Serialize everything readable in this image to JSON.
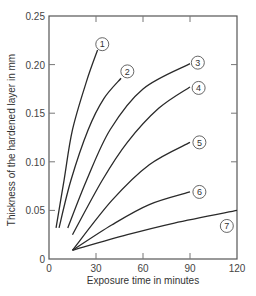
{
  "chart_data": {
    "type": "line",
    "title": "",
    "xlabel": "Exposure time in minutes",
    "ylabel": "Thickness of the hardened layer in mm",
    "xlim": [
      0,
      120
    ],
    "ylim": [
      0,
      0.25
    ],
    "xticks": [
      0,
      30,
      60,
      90,
      120
    ],
    "xtick_labels": [
      "0",
      "30",
      "60",
      "90",
      "120"
    ],
    "yticks": [
      0,
      0.05,
      0.1,
      0.15,
      0.2,
      0.25
    ],
    "ytick_labels": [
      "0",
      "0.05",
      "0.10",
      "0.15",
      "0.20",
      "0.25"
    ],
    "grid": false,
    "legend": "inline circled numbers at curve ends",
    "series": [
      {
        "name": "1",
        "points": [
          [
            4.5,
            0.032
          ],
          [
            9.6,
            0.081
          ],
          [
            15,
            0.133
          ],
          [
            24,
            0.183
          ],
          [
            31,
            0.215
          ]
        ],
        "label_pos": [
          34,
          0.221
        ]
      },
      {
        "name": "2",
        "points": [
          [
            6.4,
            0.032
          ],
          [
            14,
            0.081
          ],
          [
            25,
            0.133
          ],
          [
            35,
            0.165
          ],
          [
            46,
            0.186
          ]
        ],
        "label_pos": [
          50,
          0.193
        ]
      },
      {
        "name": "3",
        "points": [
          [
            12,
            0.032
          ],
          [
            24,
            0.081
          ],
          [
            39,
            0.133
          ],
          [
            60,
            0.175
          ],
          [
            90,
            0.201
          ]
        ],
        "label_pos": [
          95,
          0.202
        ]
      },
      {
        "name": "4",
        "points": [
          [
            15,
            0.025
          ],
          [
            34,
            0.081
          ],
          [
            50,
            0.12
          ],
          [
            70,
            0.155
          ],
          [
            90,
            0.177
          ]
        ],
        "label_pos": [
          95.5,
          0.176
        ]
      },
      {
        "name": "5",
        "points": [
          [
            15,
            0.009
          ],
          [
            40,
            0.06
          ],
          [
            64,
            0.097
          ],
          [
            90,
            0.12
          ]
        ],
        "label_pos": [
          96,
          0.12
        ]
      },
      {
        "name": "6",
        "points": [
          [
            15,
            0.009
          ],
          [
            40,
            0.035
          ],
          [
            64,
            0.056
          ],
          [
            90,
            0.069
          ]
        ],
        "label_pos": [
          96,
          0.069
        ]
      },
      {
        "name": "7",
        "points": [
          [
            15,
            0.009
          ],
          [
            50,
            0.025
          ],
          [
            80,
            0.037
          ],
          [
            120,
            0.05
          ]
        ],
        "label_pos": [
          113.5,
          0.034
        ]
      }
    ]
  }
}
